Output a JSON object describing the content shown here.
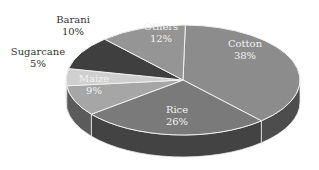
{
  "chart_data": {
    "type": "pie",
    "style": "3d",
    "title": "",
    "slices": [
      {
        "label": "Cotton",
        "value": 38,
        "value_label": "38%",
        "color": "#8c8c8c"
      },
      {
        "label": "Rice",
        "value": 26,
        "value_label": "26%",
        "color": "#7a7a7a"
      },
      {
        "label": "Maize",
        "value": 9,
        "value_label": "9%",
        "color": "#a6a6a6"
      },
      {
        "label": "Sugarcane",
        "value": 5,
        "value_label": "5%",
        "color": "#cfcfcf"
      },
      {
        "label": "Barani",
        "value": 10,
        "value_label": "10%",
        "color": "#3f3f3f"
      },
      {
        "label": "Others",
        "value": 12,
        "value_label": "12%",
        "color": "#959595"
      }
    ],
    "legend": "none",
    "data_labels": "inside/outside"
  },
  "labels": {
    "cotton": {
      "name": "Cotton",
      "pct": "38%"
    },
    "rice": {
      "name": "Rice",
      "pct": "26%"
    },
    "maize": {
      "name": "Maize",
      "pct": "9%"
    },
    "sugarcane": {
      "name": "Sugarcane",
      "pct": "5%"
    },
    "barani": {
      "name": "Barani",
      "pct": "10%"
    },
    "others": {
      "name": "Others",
      "pct": "12%"
    }
  }
}
